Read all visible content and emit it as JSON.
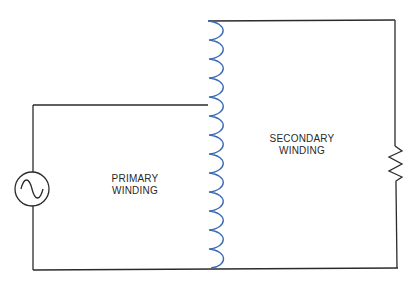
{
  "diagram": {
    "type": "transformer-circuit",
    "labels": {
      "primary": [
        "PRIMARY",
        "WINDING"
      ],
      "secondary": [
        "SECONDARY",
        "WINDING"
      ]
    },
    "components": [
      {
        "id": "ac-source",
        "kind": "ac-voltage-source",
        "symbol": "sine-in-circle"
      },
      {
        "id": "coil",
        "kind": "tapped-inductor",
        "turns": 13,
        "tap_turn": 4
      },
      {
        "id": "load",
        "kind": "resistor",
        "symbol": "zigzag"
      }
    ],
    "colors": {
      "wire": "#2b2b2b",
      "coil": "#3a6bb5",
      "background": "#ffffff"
    }
  }
}
